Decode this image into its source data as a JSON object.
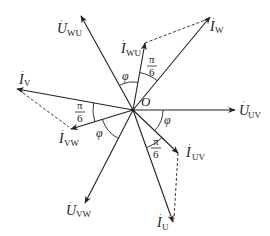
{
  "diagram": {
    "origin": {
      "label": "O",
      "x": 133,
      "y": 110
    },
    "colors": {
      "stroke": "#222222",
      "background": "#ffffff"
    },
    "phasors": [
      {
        "id": "U_UV",
        "symbol": "U",
        "sub": "UV",
        "tip": [
          235,
          110
        ],
        "style": "solid"
      },
      {
        "id": "U_WU",
        "symbol": "U",
        "sub": "WU",
        "tip": [
          81,
          16
        ],
        "style": "solid"
      },
      {
        "id": "U_VW",
        "symbol": "U",
        "sub": "VW",
        "tip": [
          85,
          203
        ],
        "style": "solid"
      },
      {
        "id": "I_W",
        "symbol": "I",
        "sub": "W",
        "tip": [
          210,
          17
        ],
        "style": "solid"
      },
      {
        "id": "I_WU",
        "symbol": "I",
        "sub": "WU",
        "tip": [
          145,
          43
        ],
        "style": "solid"
      },
      {
        "id": "I_V",
        "symbol": "I",
        "sub": "V",
        "tip": [
          17,
          89
        ],
        "style": "solid"
      },
      {
        "id": "I_VW",
        "symbol": "I",
        "sub": "VW",
        "tip": [
          71,
          129
        ],
        "style": "solid"
      },
      {
        "id": "I_UV",
        "symbol": "I",
        "sub": "UV",
        "tip": [
          178,
          153
        ],
        "style": "solid"
      },
      {
        "id": "I_U",
        "symbol": "I",
        "sub": "U",
        "tip": [
          173,
          222
        ],
        "style": "solid"
      }
    ],
    "dashed_lines": [
      {
        "from": "I_WU",
        "to": "I_W"
      },
      {
        "from": "I_V",
        "to": "I_VW"
      },
      {
        "from": "I_UV",
        "to": "I_U"
      }
    ],
    "angles": [
      {
        "label": "φ",
        "between": [
          "U_WU",
          "I_WU"
        ]
      },
      {
        "label": "π/6",
        "between": [
          "I_WU",
          "I_W"
        ]
      },
      {
        "label": "π/6",
        "between": [
          "I_V",
          "I_VW"
        ]
      },
      {
        "label": "φ",
        "between": [
          "I_VW",
          "U_VW"
        ]
      },
      {
        "label": "φ",
        "between": [
          "U_UV",
          "I_UV"
        ]
      },
      {
        "label": "π/6",
        "between": [
          "I_UV",
          "I_U"
        ]
      }
    ],
    "labels": {
      "origin": "O",
      "phi": "φ",
      "pi": "π",
      "six": "6",
      "U": "U",
      "I": "I",
      "UV": "UV",
      "WU": "WU",
      "VW": "VW",
      "W": "W",
      "V": "V",
      "U_sub": "U"
    }
  }
}
